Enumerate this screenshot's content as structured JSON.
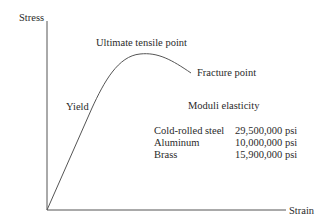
{
  "diagram": {
    "axes": {
      "y_label": "Stress",
      "x_label": "Strain"
    },
    "annotations": {
      "ultimate": "Ultimate tensile point",
      "fracture": "Fracture point",
      "yield": "Yield"
    },
    "moduli": {
      "title": "Moduli elasticity",
      "rows": [
        {
          "material": "Cold-rolled steel",
          "value": "29,500,000 psi"
        },
        {
          "material": "Aluminum",
          "value": "10,000,000 psi"
        },
        {
          "material": "Brass",
          "value": "15,900,000 psi"
        }
      ]
    },
    "colors": {
      "line": "#555555",
      "text": "#2a2a2a",
      "background": "#ffffff"
    }
  }
}
